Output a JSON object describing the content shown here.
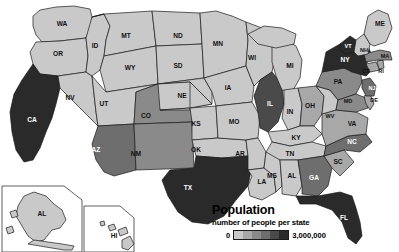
{
  "map": {
    "title": "United States population choropleth map",
    "projection": "albers-usa",
    "background_color": "#ffffff",
    "border_color": "#1a1a1a"
  },
  "legend": {
    "name": "population-legend",
    "title": "Population",
    "subtitle": "number of people per state",
    "min_label": "0",
    "max_label": "3,000,000",
    "ramp_colors": [
      "#c9c9c9",
      "#a8a8a8",
      "#8a8a8a",
      "#6e6e6e",
      "#4a4a4a",
      "#2a2a2a"
    ]
  },
  "insets": [
    {
      "name": "alaska-inset",
      "label": "AL"
    },
    {
      "name": "hawaii-inset",
      "label": "HI"
    }
  ],
  "chart_data": {
    "type": "choropleth",
    "title": "Population",
    "subtitle": "number of people per state",
    "value_unit": "number of people per state",
    "scale_min": 0,
    "scale_max": 3000000,
    "color_scale": [
      "#c9c9c9",
      "#a8a8a8",
      "#8a8a8a",
      "#6e6e6e",
      "#4a4a4a",
      "#2a2a2a"
    ],
    "legend_position": "bottom-right",
    "states": [
      {
        "code": "WA",
        "bin": 1,
        "color": "#c9c9c9"
      },
      {
        "code": "OR",
        "bin": 1,
        "color": "#c9c9c9"
      },
      {
        "code": "CA",
        "bin": 6,
        "color": "#2a2a2a"
      },
      {
        "code": "NV",
        "bin": 1,
        "color": "#c9c9c9"
      },
      {
        "code": "ID",
        "bin": 1,
        "color": "#c9c9c9"
      },
      {
        "code": "MT",
        "bin": 1,
        "color": "#c9c9c9"
      },
      {
        "code": "WY",
        "bin": 1,
        "color": "#c9c9c9"
      },
      {
        "code": "UT",
        "bin": 1,
        "color": "#c9c9c9"
      },
      {
        "code": "AZ",
        "bin": 4,
        "color": "#6e6e6e"
      },
      {
        "code": "CO",
        "bin": 3,
        "color": "#8a8a8a"
      },
      {
        "code": "NM",
        "bin": 3,
        "color": "#8a8a8a"
      },
      {
        "code": "ND",
        "bin": 1,
        "color": "#c9c9c9"
      },
      {
        "code": "SD",
        "bin": 1,
        "color": "#c9c9c9"
      },
      {
        "code": "NE",
        "bin": 1,
        "color": "#c9c9c9"
      },
      {
        "code": "KS",
        "bin": 1,
        "color": "#c9c9c9"
      },
      {
        "code": "OK",
        "bin": 1,
        "color": "#c9c9c9"
      },
      {
        "code": "TX",
        "bin": 6,
        "color": "#2a2a2a"
      },
      {
        "code": "MN",
        "bin": 1,
        "color": "#c9c9c9"
      },
      {
        "code": "IA",
        "bin": 1,
        "color": "#c9c9c9"
      },
      {
        "code": "MO",
        "bin": 1,
        "color": "#c9c9c9"
      },
      {
        "code": "AR",
        "bin": 1,
        "color": "#c9c9c9"
      },
      {
        "code": "LA",
        "bin": 1,
        "color": "#c9c9c9"
      },
      {
        "code": "WI",
        "bin": 1,
        "color": "#c9c9c9"
      },
      {
        "code": "IL",
        "bin": 5,
        "color": "#4a4a4a"
      },
      {
        "code": "MI",
        "bin": 1,
        "color": "#c9c9c9"
      },
      {
        "code": "IN",
        "bin": 1,
        "color": "#c9c9c9"
      },
      {
        "code": "OH",
        "bin": 2,
        "color": "#a8a8a8"
      },
      {
        "code": "KY",
        "bin": 1,
        "color": "#c9c9c9"
      },
      {
        "code": "TN",
        "bin": 1,
        "color": "#c9c9c9"
      },
      {
        "code": "MS",
        "bin": 1,
        "color": "#c9c9c9"
      },
      {
        "code": "AL",
        "bin": 1,
        "color": "#c9c9c9"
      },
      {
        "code": "GA",
        "bin": 4,
        "color": "#6e6e6e"
      },
      {
        "code": "FL",
        "bin": 6,
        "color": "#2a2a2a"
      },
      {
        "code": "SC",
        "bin": 2,
        "color": "#a8a8a8"
      },
      {
        "code": "NC",
        "bin": 4,
        "color": "#6e6e6e"
      },
      {
        "code": "VA",
        "bin": 2,
        "color": "#a8a8a8"
      },
      {
        "code": "WV",
        "bin": 1,
        "color": "#c9c9c9"
      },
      {
        "code": "MD",
        "bin": 3,
        "color": "#8a8a8a"
      },
      {
        "code": "DE",
        "bin": 2,
        "color": "#a8a8a8"
      },
      {
        "code": "PA",
        "bin": 3,
        "color": "#8a8a8a"
      },
      {
        "code": "NJ",
        "bin": 4,
        "color": "#6e6e6e"
      },
      {
        "code": "NY",
        "bin": 6,
        "color": "#2a2a2a"
      },
      {
        "code": "CT",
        "bin": 2,
        "color": "#a8a8a8"
      },
      {
        "code": "RI",
        "bin": 2,
        "color": "#a8a8a8"
      },
      {
        "code": "MA",
        "bin": 3,
        "color": "#8a8a8a"
      },
      {
        "code": "VT",
        "bin": 6,
        "color": "#2a2a2a"
      },
      {
        "code": "NH",
        "bin": 1,
        "color": "#c9c9c9"
      },
      {
        "code": "ME",
        "bin": 1,
        "color": "#c9c9c9"
      },
      {
        "code": "AK",
        "bin": 1,
        "color": "#c9c9c9",
        "label": "AL"
      },
      {
        "code": "HI",
        "bin": 1,
        "color": "#c9c9c9",
        "label": "HI"
      }
    ]
  }
}
